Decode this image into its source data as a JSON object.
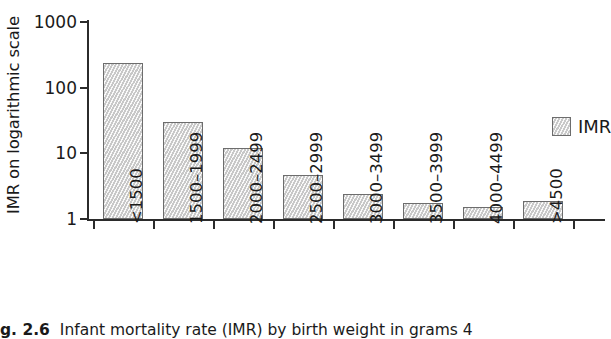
{
  "chart_data": {
    "type": "bar",
    "title": "",
    "xlabel": "birth weight in grams",
    "ylabel": "IMR on logarithmic scale",
    "yscale": "log",
    "ylim": [
      1,
      1000
    ],
    "yticks": [
      1000,
      100,
      10,
      1
    ],
    "ytick_labels": [
      "1000",
      "100",
      "10",
      "1"
    ],
    "grid": false,
    "legend_position": "right",
    "categories": [
      "<1500",
      "1500–1999",
      "2000–2499",
      "2500–2999",
      "3000–3499",
      "3500–3999",
      "4000–4499",
      ">4500"
    ],
    "series": [
      {
        "name": "IMR",
        "values": [
          240,
          30,
          12,
          4.7,
          2.4,
          1.75,
          1.5,
          1.85
        ]
      }
    ]
  },
  "legend": {
    "entries": [
      {
        "label": "IMR",
        "color": "#d9d9d9"
      }
    ]
  },
  "caption": {
    "number": "g. 2.6",
    "text": "Infant mortality rate (IMR) by birth weight in grams 4"
  }
}
